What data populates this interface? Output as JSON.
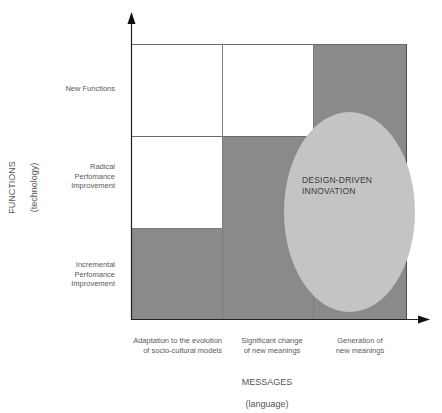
{
  "diagram": {
    "colors": {
      "dark_cell": "#8a8a8a",
      "white_cell": "#ffffff",
      "ellipse": "#c4c4c4",
      "axis": "#222222",
      "grid_line": "#6b6b6b"
    },
    "y_axis": {
      "title": "FUNCTIONS",
      "subtitle": "(technology)",
      "rows": [
        {
          "label": "New Functions"
        },
        {
          "label": "Radical\nPerfomance\nImprovement"
        },
        {
          "label": "Incremental\nPerfomance\nImprovement"
        }
      ]
    },
    "x_axis": {
      "title": "MESSAGES",
      "subtitle": "(language)",
      "columns": [
        {
          "label": "Adaptation to the evolution\nof socio-cultural models"
        },
        {
          "label": "Significant change\nof new meanings"
        },
        {
          "label": "Generation of\nnew meanings"
        }
      ]
    },
    "grid": [
      [
        "white",
        "white",
        "dark"
      ],
      [
        "white",
        "dark",
        "dark"
      ],
      [
        "dark",
        "dark",
        "dark"
      ]
    ],
    "highlight": {
      "label": "DESIGN-DRIVEN\nINNOVATION"
    }
  }
}
